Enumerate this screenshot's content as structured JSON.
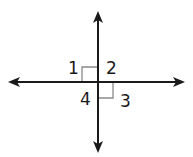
{
  "diagram": {
    "type": "perpendicular-lines",
    "line_color": "#1a1a1a",
    "marker_color": "#8a8a8a",
    "angles": [
      {
        "label": "1"
      },
      {
        "label": "2"
      },
      {
        "label": "3"
      },
      {
        "label": "4"
      }
    ]
  }
}
